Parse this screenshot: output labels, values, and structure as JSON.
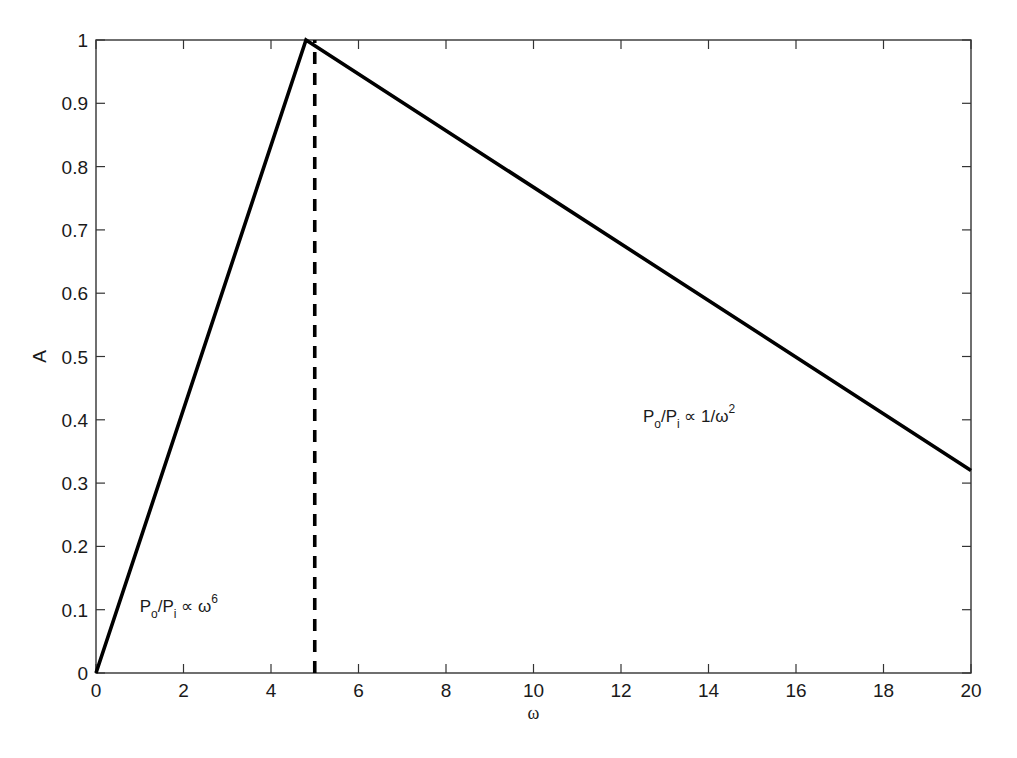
{
  "chart_data": {
    "type": "line",
    "title": "",
    "xlabel": "ω",
    "ylabel": "A",
    "xlim": [
      0,
      20
    ],
    "ylim": [
      0,
      1
    ],
    "xticks": [
      0,
      2,
      4,
      6,
      8,
      10,
      12,
      14,
      16,
      18,
      20
    ],
    "yticks": [
      0,
      0.1,
      0.2,
      0.3,
      0.4,
      0.5,
      0.6,
      0.7,
      0.8,
      0.9,
      1
    ],
    "xtick_labels": [
      "0",
      "2",
      "4",
      "6",
      "8",
      "10",
      "12",
      "14",
      "16",
      "18",
      "20"
    ],
    "ytick_labels": [
      "0",
      "0.1",
      "0.2",
      "0.3",
      "0.4",
      "0.5",
      "0.6",
      "0.7",
      "0.8",
      "0.9",
      "1"
    ],
    "grid": false,
    "legend": null,
    "series": [
      {
        "name": "A(ω)",
        "style": "solid",
        "color": "#000000",
        "x": [
          0,
          4.8,
          20
        ],
        "y": [
          0,
          1.0,
          0.32
        ]
      },
      {
        "name": "resonance marker",
        "style": "dashed",
        "color": "#000000",
        "x": [
          5,
          5
        ],
        "y": [
          0,
          1.0
        ]
      }
    ],
    "annotations": [
      {
        "text": "P_o/P_i ∝ ω^6",
        "x": 1.0,
        "y": 0.1,
        "base1": "P",
        "sub1": "o",
        "mid": "/P",
        "sub2": "i",
        "rel": " ∝ ω",
        "sup": "6"
      },
      {
        "text": "P_o/P_i ∝ 1/ω^2",
        "x": 12.5,
        "y": 0.4,
        "base1": "P",
        "sub1": "o",
        "mid": "/P",
        "sub2": "i",
        "rel": " ∝ 1/ω",
        "sup": "2"
      }
    ]
  }
}
